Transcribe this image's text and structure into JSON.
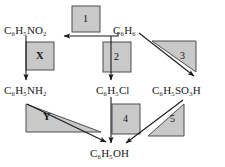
{
  "diagram": {
    "background_color": "#ffffff",
    "box_fill_color": "#c9c9c9",
    "box_stroke_color": "#4d4d4d",
    "arrow_color": "#1a1a1a",
    "text_color": "#1a1a1a",
    "species": [
      {
        "id": "nitrobenzene",
        "label": "C6H5NO2",
        "display": "C₆H₅NO₂",
        "x": 4,
        "y": 25
      },
      {
        "id": "benzene",
        "label": "C6H6",
        "display": "C₆H₆",
        "x": 113,
        "y": 25
      },
      {
        "id": "aniline",
        "label": "C6H5NH2",
        "display": "C₆H₅NH₂",
        "x": 4,
        "y": 85
      },
      {
        "id": "chlorobenzene",
        "label": "C6H5Cl",
        "display": "C₆H₅Cl",
        "x": 96,
        "y": 85
      },
      {
        "id": "benzenesulfonic",
        "label": "C6H5SO3H",
        "display": "C₆H₅SO₃H",
        "x": 152,
        "y": 85
      },
      {
        "id": "phenol",
        "label": "C6H5OH",
        "display": "C₆H₅OH",
        "x": 90,
        "y": 148
      }
    ],
    "steps": [
      {
        "id": "step-1",
        "label": "1",
        "shape": "rectangle",
        "bold": false,
        "from": "benzene",
        "to": "nitrobenzene"
      },
      {
        "id": "step-x",
        "label": "X",
        "shape": "rectangle",
        "bold": true,
        "from": "nitrobenzene",
        "to": "aniline"
      },
      {
        "id": "step-2",
        "label": "2",
        "shape": "rectangle",
        "bold": false,
        "from": "benzene",
        "to": "chlorobenzene"
      },
      {
        "id": "step-3",
        "label": "3",
        "shape": "triangle",
        "bold": false,
        "from": "benzene",
        "to": "benzenesulfonic"
      },
      {
        "id": "step-y",
        "label": "Y",
        "shape": "triangle",
        "bold": true,
        "from": "aniline",
        "to": "phenol"
      },
      {
        "id": "step-4",
        "label": "4",
        "shape": "rectangle",
        "bold": false,
        "from": "chlorobenzene",
        "to": "phenol"
      },
      {
        "id": "step-5",
        "label": "5",
        "shape": "triangle",
        "bold": false,
        "from": "benzenesulfonic",
        "to": "phenol"
      }
    ]
  }
}
